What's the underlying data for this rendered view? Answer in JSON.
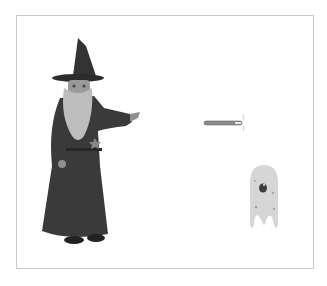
{
  "stage": {
    "sprites": [
      {
        "name": "wizard",
        "x": 38,
        "y": 36,
        "w": 105,
        "h": 210
      },
      {
        "name": "wand",
        "x": 203,
        "y": 112,
        "w": 43,
        "h": 22
      },
      {
        "name": "ghost",
        "x": 246,
        "y": 163,
        "w": 36,
        "h": 70
      }
    ]
  },
  "colors": {
    "robe": "#3a3a3a",
    "beard": "#bdbdbd",
    "face": "#9a9a9a",
    "wand": "#8a8a8a",
    "ghost": "#d6d6d6",
    "border": "#c8c8c8"
  }
}
